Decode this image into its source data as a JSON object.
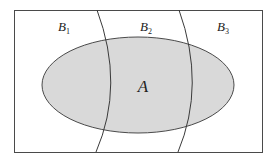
{
  "diagram": {
    "type": "venn-partition",
    "colors": {
      "background": "#ffffff",
      "stroke": "#4a4a4a",
      "ellipse_fill": "#d9d9d9",
      "text": "#222222"
    },
    "universe": {
      "x": 14,
      "y": 10,
      "width": 248,
      "height": 142
    },
    "ellipse": {
      "label": "A",
      "cx": 138,
      "cy": 85,
      "rx": 96,
      "ry": 48,
      "label_pos": {
        "x": 143,
        "y": 92
      }
    },
    "regions": [
      {
        "base": "B",
        "sub": "1",
        "label_pos": {
          "x": 58,
          "y": 31
        }
      },
      {
        "base": "B",
        "sub": "2",
        "label_pos": {
          "x": 140,
          "y": 31
        }
      },
      {
        "base": "B",
        "sub": "3",
        "label_pos": {
          "x": 217,
          "y": 31
        }
      }
    ],
    "dividers": [
      {
        "path": "M 97 10 Q 125 85 96 152"
      },
      {
        "path": "M 179 10 Q 206 85 178 152"
      }
    ]
  }
}
